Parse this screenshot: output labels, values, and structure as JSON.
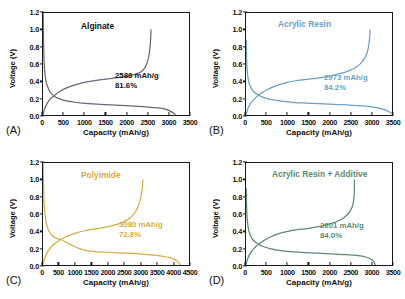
{
  "figure": {
    "axis_titles": {
      "x": "Capacity (mAh/g)",
      "y": "Voltage (V)"
    }
  },
  "chart_data": [
    {
      "type": "line",
      "panel": "(A)",
      "title": "Alginate",
      "color": "#6b6476",
      "xlabel": "Capacity (mAh/g)",
      "ylabel": "Voltage (V)",
      "xlim": [
        0,
        3500
      ],
      "ylim": [
        0.0,
        1.2
      ],
      "xticks": [
        0,
        500,
        1000,
        1500,
        2000,
        2500,
        3000,
        3500
      ],
      "yticks": [
        0.0,
        0.2,
        0.4,
        0.6,
        0.8,
        1.0,
        1.2
      ],
      "grid": false,
      "legend": false,
      "annotations": [
        "2588 mAh/g",
        "81.6%"
      ],
      "discharge_capacity": 3172,
      "charge_capacity": 2588,
      "coulombic_efficiency": "81.6%",
      "series": [
        {
          "name": "discharge",
          "points": [
            [
              5,
              1.2
            ],
            [
              12,
              0.9
            ],
            [
              22,
              0.7
            ],
            [
              35,
              0.55
            ],
            [
              55,
              0.45
            ],
            [
              80,
              0.38
            ],
            [
              115,
              0.33
            ],
            [
              160,
              0.28
            ],
            [
              215,
              0.245
            ],
            [
              285,
              0.215
            ],
            [
              370,
              0.195
            ],
            [
              470,
              0.178
            ],
            [
              600,
              0.163
            ],
            [
              760,
              0.15
            ],
            [
              950,
              0.14
            ],
            [
              1200,
              0.13
            ],
            [
              1500,
              0.122
            ],
            [
              1850,
              0.113
            ],
            [
              2200,
              0.104
            ],
            [
              2520,
              0.094
            ],
            [
              2760,
              0.083
            ],
            [
              2930,
              0.068
            ],
            [
              3040,
              0.048
            ],
            [
              3110,
              0.028
            ],
            [
              3160,
              0.01
            ],
            [
              3172,
              0.0
            ]
          ]
        },
        {
          "name": "charge",
          "points": [
            [
              0,
              0.005
            ],
            [
              30,
              0.06
            ],
            [
              70,
              0.11
            ],
            [
              130,
              0.16
            ],
            [
              210,
              0.205
            ],
            [
              310,
              0.245
            ],
            [
              430,
              0.285
            ],
            [
              570,
              0.32
            ],
            [
              730,
              0.348
            ],
            [
              900,
              0.372
            ],
            [
              1080,
              0.392
            ],
            [
              1270,
              0.408
            ],
            [
              1460,
              0.42
            ],
            [
              1650,
              0.432
            ],
            [
              1840,
              0.444
            ],
            [
              2020,
              0.458
            ],
            [
              2180,
              0.476
            ],
            [
              2320,
              0.5
            ],
            [
              2420,
              0.54
            ],
            [
              2490,
              0.605
            ],
            [
              2540,
              0.7
            ],
            [
              2570,
              0.82
            ],
            [
              2585,
              0.94
            ],
            [
              2588,
              1.0
            ]
          ]
        }
      ]
    },
    {
      "type": "line",
      "panel": "(B)",
      "title": "Acrylic Resin",
      "color": "#6b9fc4",
      "xlabel": "Capacity (mAh/g)",
      "ylabel": "Voltage (V)",
      "xlim": [
        0,
        3500
      ],
      "ylim": [
        0.0,
        1.2
      ],
      "xticks": [
        0,
        500,
        1000,
        1500,
        2000,
        2500,
        3000,
        3500
      ],
      "yticks": [
        0.0,
        0.2,
        0.4,
        0.6,
        0.8,
        1.0,
        1.2
      ],
      "grid": false,
      "legend": false,
      "annotations": [
        "2973 mAh/g",
        "84.2%"
      ],
      "discharge_capacity": 3530,
      "charge_capacity": 2973,
      "coulombic_efficiency": "84.2%",
      "series": [
        {
          "name": "discharge",
          "points": [
            [
              5,
              0.88
            ],
            [
              15,
              0.66
            ],
            [
              30,
              0.52
            ],
            [
              50,
              0.43
            ],
            [
              78,
              0.37
            ],
            [
              115,
              0.325
            ],
            [
              165,
              0.288
            ],
            [
              225,
              0.258
            ],
            [
              300,
              0.233
            ],
            [
              390,
              0.213
            ],
            [
              495,
              0.196
            ],
            [
              620,
              0.181
            ],
            [
              770,
              0.168
            ],
            [
              950,
              0.157
            ],
            [
              1170,
              0.147
            ],
            [
              1430,
              0.14
            ],
            [
              1750,
              0.133
            ],
            [
              2100,
              0.126
            ],
            [
              2450,
              0.118
            ],
            [
              2780,
              0.108
            ],
            [
              3050,
              0.094
            ],
            [
              3250,
              0.074
            ],
            [
              3390,
              0.048
            ],
            [
              3480,
              0.022
            ],
            [
              3530,
              0.002
            ]
          ]
        },
        {
          "name": "charge",
          "points": [
            [
              0,
              0.005
            ],
            [
              35,
              0.062
            ],
            [
              85,
              0.115
            ],
            [
              155,
              0.165
            ],
            [
              245,
              0.21
            ],
            [
              355,
              0.252
            ],
            [
              485,
              0.292
            ],
            [
              635,
              0.328
            ],
            [
              800,
              0.358
            ],
            [
              975,
              0.382
            ],
            [
              1160,
              0.4
            ],
            [
              1350,
              0.414
            ],
            [
              1545,
              0.425
            ],
            [
              1740,
              0.438
            ],
            [
              1930,
              0.452
            ],
            [
              2110,
              0.47
            ],
            [
              2290,
              0.492
            ],
            [
              2460,
              0.52
            ],
            [
              2615,
              0.556
            ],
            [
              2745,
              0.605
            ],
            [
              2850,
              0.672
            ],
            [
              2920,
              0.76
            ],
            [
              2955,
              0.868
            ],
            [
              2970,
              0.95
            ],
            [
              2973,
              1.0
            ]
          ]
        }
      ]
    },
    {
      "type": "line",
      "panel": "(C)",
      "title": "Polyimide",
      "color": "#d6ad44",
      "xlabel": "Capacity (mAh/g)",
      "ylabel": "Voltage (V)",
      "xlim": [
        0,
        4500
      ],
      "ylim": [
        0.0,
        1.2
      ],
      "xticks": [
        0,
        500,
        1000,
        1500,
        2000,
        2500,
        3000,
        3500,
        4000,
        4500
      ],
      "yticks": [
        0.0,
        0.2,
        0.4,
        0.6,
        0.8,
        1.0,
        1.2
      ],
      "grid": false,
      "legend": false,
      "annotations": [
        "3080 mAh/g",
        "72.8%"
      ],
      "discharge_capacity": 4230,
      "charge_capacity": 3080,
      "coulombic_efficiency": "72.8%",
      "series": [
        {
          "name": "discharge",
          "points": [
            [
              5,
              1.2
            ],
            [
              15,
              0.95
            ],
            [
              28,
              0.78
            ],
            [
              45,
              0.66
            ],
            [
              70,
              0.57
            ],
            [
              105,
              0.49
            ],
            [
              150,
              0.43
            ],
            [
              205,
              0.385
            ],
            [
              275,
              0.35
            ],
            [
              360,
              0.325
            ],
            [
              450,
              0.31
            ],
            [
              540,
              0.3
            ],
            [
              640,
              0.282
            ],
            [
              760,
              0.257
            ],
            [
              900,
              0.23
            ],
            [
              1060,
              0.203
            ],
            [
              1250,
              0.178
            ],
            [
              1470,
              0.162
            ],
            [
              1700,
              0.155
            ],
            [
              2000,
              0.15
            ],
            [
              2350,
              0.144
            ],
            [
              2750,
              0.136
            ],
            [
              3150,
              0.126
            ],
            [
              3500,
              0.113
            ],
            [
              3780,
              0.097
            ],
            [
              3990,
              0.075
            ],
            [
              4130,
              0.048
            ],
            [
              4200,
              0.022
            ],
            [
              4230,
              0.003
            ]
          ]
        },
        {
          "name": "charge",
          "points": [
            [
              0,
              0.008
            ],
            [
              40,
              0.068
            ],
            [
              95,
              0.122
            ],
            [
              170,
              0.172
            ],
            [
              270,
              0.218
            ],
            [
              390,
              0.258
            ],
            [
              530,
              0.296
            ],
            [
              690,
              0.33
            ],
            [
              870,
              0.358
            ],
            [
              1060,
              0.382
            ],
            [
              1260,
              0.4
            ],
            [
              1470,
              0.415
            ],
            [
              1680,
              0.428
            ],
            [
              1890,
              0.442
            ],
            [
              2090,
              0.458
            ],
            [
              2280,
              0.478
            ],
            [
              2450,
              0.502
            ],
            [
              2610,
              0.534
            ],
            [
              2750,
              0.578
            ],
            [
              2870,
              0.638
            ],
            [
              2960,
              0.716
            ],
            [
              3020,
              0.808
            ],
            [
              3060,
              0.905
            ],
            [
              3080,
              1.0
            ]
          ]
        }
      ]
    },
    {
      "type": "line",
      "panel": "(D)",
      "title": "Acrylic Resin + Additive",
      "color": "#5c8a6c",
      "xlabel": "Capacity (mAh/g)",
      "ylabel": "Voltage (V)",
      "xlim": [
        0,
        3500
      ],
      "ylim": [
        0.0,
        1.2
      ],
      "xticks": [
        0,
        500,
        1000,
        1500,
        2000,
        2500,
        3000,
        3500
      ],
      "yticks": [
        0.0,
        0.2,
        0.4,
        0.6,
        0.8,
        1.0,
        1.2
      ],
      "grid": false,
      "legend": false,
      "annotations": [
        "2601 mAh/g",
        "84.0%"
      ],
      "discharge_capacity": 3096,
      "charge_capacity": 2601,
      "coulombic_efficiency": "84.0%",
      "series": [
        {
          "name": "discharge",
          "points": [
            [
              5,
              0.9
            ],
            [
              15,
              0.68
            ],
            [
              30,
              0.54
            ],
            [
              50,
              0.45
            ],
            [
              78,
              0.385
            ],
            [
              115,
              0.338
            ],
            [
              163,
              0.3
            ],
            [
              222,
              0.27
            ],
            [
              295,
              0.245
            ],
            [
              383,
              0.224
            ],
            [
              485,
              0.206
            ],
            [
              607,
              0.19
            ],
            [
              752,
              0.176
            ],
            [
              930,
              0.164
            ],
            [
              1140,
              0.154
            ],
            [
              1400,
              0.146
            ],
            [
              1700,
              0.139
            ],
            [
              2030,
              0.132
            ],
            [
              2360,
              0.123
            ],
            [
              2650,
              0.112
            ],
            [
              2870,
              0.094
            ],
            [
              3010,
              0.064
            ],
            [
              3070,
              0.032
            ],
            [
              3096,
              0.004
            ]
          ]
        },
        {
          "name": "charge",
          "points": [
            [
              0,
              0.006
            ],
            [
              32,
              0.062
            ],
            [
              78,
              0.116
            ],
            [
              142,
              0.166
            ],
            [
              225,
              0.212
            ],
            [
              328,
              0.254
            ],
            [
              448,
              0.294
            ],
            [
              585,
              0.33
            ],
            [
              735,
              0.36
            ],
            [
              895,
              0.384
            ],
            [
              1060,
              0.402
            ],
            [
              1235,
              0.416
            ],
            [
              1405,
              0.426
            ],
            [
              1575,
              0.438
            ],
            [
              1745,
              0.452
            ],
            [
              1910,
              0.47
            ],
            [
              2070,
              0.492
            ],
            [
              2215,
              0.52
            ],
            [
              2345,
              0.556
            ],
            [
              2455,
              0.606
            ],
            [
              2540,
              0.676
            ],
            [
              2585,
              0.772
            ],
            [
              2598,
              0.89
            ],
            [
              2601,
              1.0
            ]
          ]
        }
      ]
    }
  ]
}
